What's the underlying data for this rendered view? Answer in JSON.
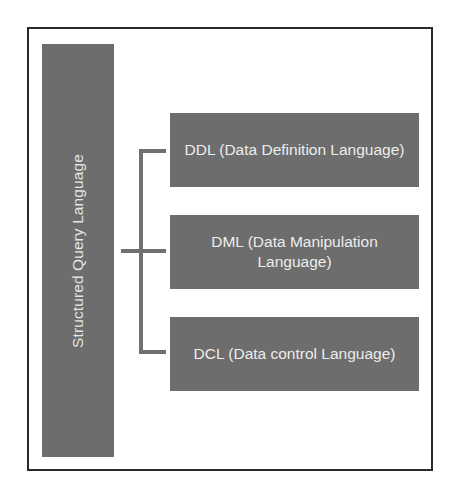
{
  "diagram": {
    "root": {
      "label": "Structured Query Language"
    },
    "children": [
      {
        "label": "DDL (Data Definition Language)"
      },
      {
        "label": "DML (Data Manipulation Language)"
      },
      {
        "label": "DCL (Data control Language)"
      }
    ],
    "colors": {
      "box_fill": "#6d6d6d",
      "box_text": "#ececec",
      "connector": "#707070",
      "frame_border": "#2a2a2a",
      "background": "#ffffff"
    }
  }
}
